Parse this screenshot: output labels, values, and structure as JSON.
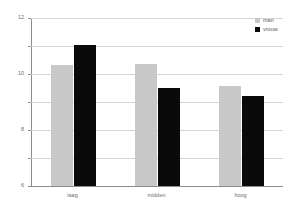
{
  "chart_data": {
    "type": "bar",
    "title": "",
    "subtitle": "",
    "xlabel": "",
    "ylabel": "",
    "categories": [
      "laag",
      "midden",
      "hoog"
    ],
    "series": [
      {
        "name": "man",
        "color": "#c8c8c8",
        "values": [
          8.65,
          8.7,
          7.15
        ]
      },
      {
        "name": "vrouw",
        "color": "#0a0a0a",
        "values": [
          10.1,
          7.0,
          6.4
        ]
      }
    ],
    "ylim": [
      0,
      12
    ],
    "y_ticks": [
      12,
      10,
      8,
      6,
      4,
      2,
      0
    ],
    "grid": true,
    "legend_position": "top-right"
  },
  "legend": {
    "entries": [
      {
        "label": "man",
        "swatch_color": "#c8c8c8"
      },
      {
        "label": "vrouw",
        "swatch_color": "#0a0a0a"
      }
    ]
  }
}
